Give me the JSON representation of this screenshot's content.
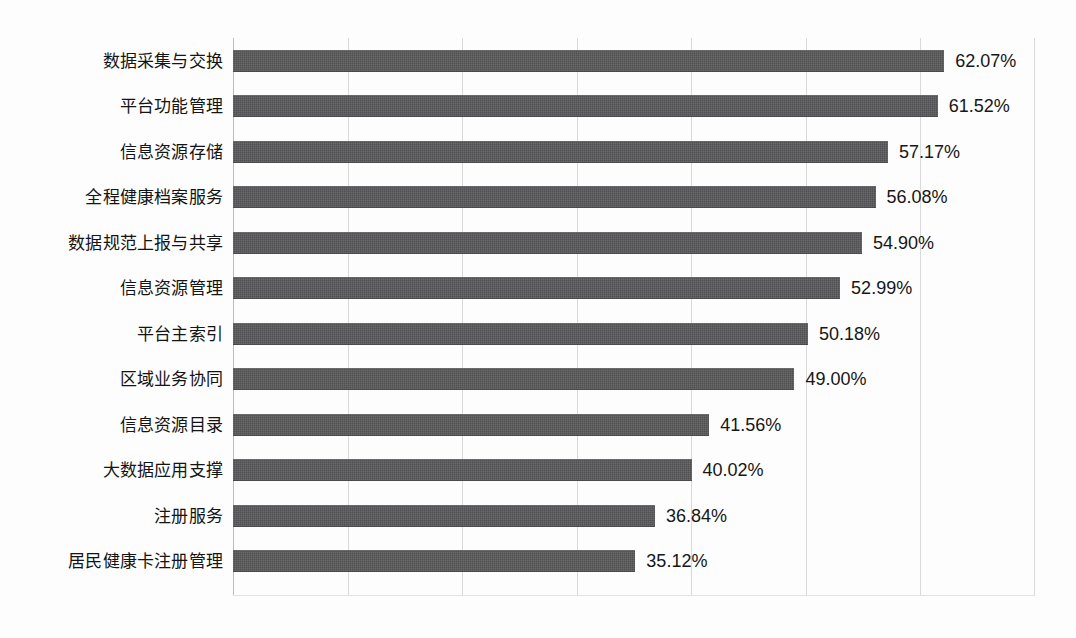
{
  "chart_data": {
    "type": "bar",
    "orientation": "horizontal",
    "title": "",
    "subtitle": "",
    "xlabel": "",
    "ylabel": "",
    "categories": [
      "数据采集与交换",
      "平台功能管理",
      "信息资源存储",
      "全程健康档案服务",
      "数据规范上报与共享",
      "信息资源管理",
      "平台主索引",
      "区域业务协同",
      "信息资源目录",
      "大数据应用支撑",
      "注册服务",
      "居民健康卡注册管理"
    ],
    "values": [
      62.07,
      61.52,
      57.17,
      56.08,
      54.9,
      52.99,
      50.18,
      49.0,
      41.56,
      40.02,
      36.84,
      35.12
    ],
    "value_labels": [
      "62.07%",
      "61.52%",
      "57.17%",
      "56.08%",
      "54.90%",
      "52.99%",
      "50.18%",
      "49.00%",
      "41.56%",
      "40.02%",
      "36.84%",
      "35.12%"
    ],
    "unit": "%",
    "xlim": [
      0,
      70
    ],
    "xtick_values": [
      0,
      10,
      20,
      30,
      40,
      50,
      60,
      70
    ],
    "xtick_labels": [
      "",
      "",
      "",
      "",
      "",
      "",
      "",
      ""
    ],
    "grid": true,
    "grid_axis": "x",
    "legend": false,
    "legend_position": "none",
    "data_labels": true,
    "data_label_position": "outside-end",
    "colors": {
      "bar": "#58585a",
      "gridline": "#d9d9d9",
      "axis": "#bdbdbd",
      "text": "#141414",
      "background": "#fdfdfd"
    }
  }
}
